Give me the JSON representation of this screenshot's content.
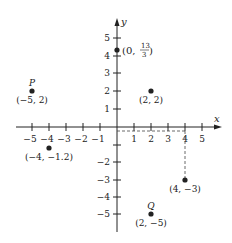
{
  "axes": {
    "x_label": "x",
    "y_label": "y",
    "x_ticks": [
      -5,
      -4,
      -3,
      -2,
      -1,
      1,
      2,
      3,
      4,
      5
    ],
    "y_ticks": [
      5,
      4,
      3,
      2,
      1,
      -2,
      -3,
      -4,
      -5
    ],
    "x_tick_labels": [
      "−5",
      "−4",
      "−3",
      "−2",
      "−1",
      "1",
      "2",
      "3",
      "4",
      "5"
    ],
    "y_tick_labels": [
      "5",
      "4",
      "3",
      "2",
      "1",
      "−2",
      "−3",
      "−4",
      "−5"
    ]
  },
  "points": [
    {
      "name": "",
      "label": "(0, 13/3)",
      "x": 0,
      "y": 4.333
    },
    {
      "name": "P",
      "label": "(−5, 2)",
      "x": -5,
      "y": 2
    },
    {
      "name": "",
      "label": "(2, 2)",
      "x": 2,
      "y": 2
    },
    {
      "name": "",
      "label": "(−4, −1.2)",
      "x": -4,
      "y": -1.2
    },
    {
      "name": "",
      "label": "(4, −3)",
      "x": 4,
      "y": -3
    },
    {
      "name": "Q",
      "label": "(2, −5)",
      "x": 2,
      "y": -5
    }
  ],
  "labels": {
    "p_name": "P",
    "p_coord": "(−5, 2)",
    "q_name": "Q",
    "q_coord": "(2, −5)",
    "pt_22": "(2, 2)",
    "pt_m4": "(−4, −1.2)",
    "pt_4m3": "(4, −3)",
    "pt_13_open": "(0, ",
    "pt_13_num": "13",
    "pt_13_den": "3",
    "pt_13_close": ")"
  },
  "guides": {
    "dashed_from": [
      4,
      -3
    ],
    "to_axes": true
  }
}
